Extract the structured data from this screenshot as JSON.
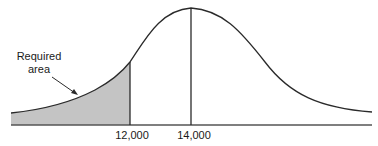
{
  "diagram": {
    "type": "normal-distribution",
    "annotation": {
      "line1": "Required",
      "line2": "area"
    },
    "ticks": [
      {
        "label": "12,000",
        "x": 130
      },
      {
        "label": "14,000",
        "x": 191
      }
    ],
    "shaded_region": "left tail below 12,000",
    "mean": "14,000",
    "colors": {
      "curve": "#2a2a2a",
      "shade": "#c4c4c4",
      "baseline": "#555555"
    }
  }
}
